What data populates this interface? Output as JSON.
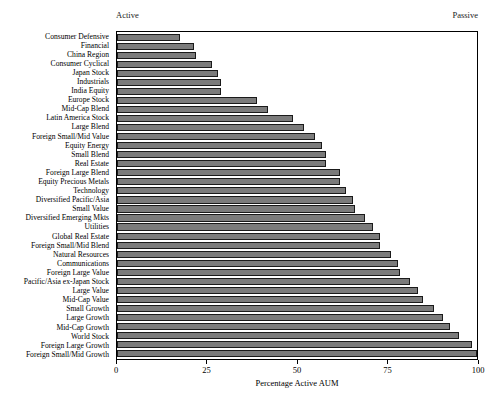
{
  "header": {
    "left_label": "Active",
    "right_label": "Passive"
  },
  "axis": {
    "x_title": "Percentage Active AUM",
    "ticks": [
      0,
      25,
      50,
      75,
      100
    ],
    "tick_labels": [
      "0",
      "25",
      "50",
      "75",
      "100"
    ]
  },
  "colors": {
    "bar_fill": "#7b7b7b",
    "bar_border": "#1a1a1a",
    "plot_background": "#ffffff",
    "frame": "#000000",
    "text": "#000000"
  },
  "chart_data": {
    "type": "bar",
    "orientation": "horizontal",
    "title": "",
    "subtitle": "",
    "xlabel": "Percentage Active AUM",
    "ylabel": "",
    "xlim": [
      0,
      100
    ],
    "grid": false,
    "legend": "none",
    "annotations": [
      "Active",
      "Passive"
    ],
    "categories": [
      "Consumer Defensive",
      "Financial",
      "China Region",
      "Consumer Cyclical",
      "Japan Stock",
      "Industrials",
      "India Equity",
      "Europe Stock",
      "Mid-Cap Blend",
      "Latin America Stock",
      "Large Blend",
      "Foreign Small/Mid Value",
      "Equity Energy",
      "Small Blend",
      "Real Estate",
      "Foreign Large Blend",
      "Equity Precious Metals",
      "Technology",
      "Diversified Pacific/Asia",
      "Small Value",
      "Diversified Emerging Mkts",
      "Utilities",
      "Global Real Estate",
      "Foreign Small/Mid Blend",
      "Natural Resources",
      "Communications",
      "Foreign Large Value",
      "Pacific/Asia ex-Japan Stock",
      "Large Value",
      "Mid-Cap Value",
      "Small Growth",
      "Large Growth",
      "Mid-Cap Growth",
      "World Stock",
      "Foreign Large Growth",
      "Foreign Small/Mid Growth"
    ],
    "values": [
      17.5,
      21.5,
      22.0,
      26.5,
      28.0,
      29.0,
      29.0,
      39.0,
      42.0,
      49.0,
      52.0,
      55.0,
      57.0,
      58.0,
      58.0,
      62.0,
      62.0,
      63.5,
      65.5,
      66.0,
      69.0,
      71.0,
      73.0,
      73.0,
      76.0,
      78.0,
      78.5,
      81.5,
      83.5,
      85.0,
      88.0,
      90.5,
      92.5,
      95.0,
      98.5,
      100.0
    ],
    "units": "percent"
  }
}
